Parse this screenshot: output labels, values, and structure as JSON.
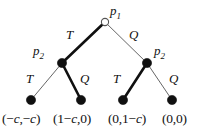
{
  "diagram": {
    "type": "extensive-form-game-tree",
    "title": "",
    "colors": {
      "line": "#555555",
      "bold_line": "#101010",
      "node_fill": "#101010",
      "root_fill": "#ffffff",
      "text": "#111111",
      "background": "#ffffff"
    },
    "nodes": [
      {
        "id": "root",
        "label": "p",
        "sub": "1",
        "x": 105,
        "y": 22,
        "filled": false,
        "r": 3.6,
        "label_x": 110,
        "label_y": 4
      },
      {
        "id": "left",
        "label": "p",
        "sub": "2",
        "x": 62,
        "y": 63,
        "filled": true,
        "r": 4.6,
        "label_x": 33,
        "label_y": 44
      },
      {
        "id": "right",
        "label": "p",
        "sub": "2",
        "x": 147,
        "y": 63,
        "filled": true,
        "r": 4.6,
        "label_x": 154,
        "label_y": 44
      },
      {
        "id": "leaf1",
        "label": "",
        "sub": "",
        "x": 31,
        "y": 100,
        "filled": true,
        "r": 4.6,
        "label_x": 0,
        "label_y": 0
      },
      {
        "id": "leaf2",
        "label": "",
        "sub": "",
        "x": 81,
        "y": 100,
        "filled": true,
        "r": 4.6,
        "label_x": 0,
        "label_y": 0
      },
      {
        "id": "leaf3",
        "label": "",
        "sub": "",
        "x": 123,
        "y": 100,
        "filled": true,
        "r": 4.6,
        "label_x": 0,
        "label_y": 0
      },
      {
        "id": "leaf4",
        "label": "",
        "sub": "",
        "x": 172,
        "y": 100,
        "filled": true,
        "r": 4.6,
        "label_x": 0,
        "label_y": 0
      }
    ],
    "edges": [
      {
        "id": "root-T",
        "from": "root",
        "to": "left",
        "label": "T",
        "bold": true,
        "label_x": 66,
        "label_y": 28
      },
      {
        "id": "root-Q",
        "from": "root",
        "to": "right",
        "label": "Q",
        "bold": false,
        "label_x": 129,
        "label_y": 28
      },
      {
        "id": "left-T",
        "from": "left",
        "to": "leaf1",
        "label": "T",
        "bold": false,
        "label_x": 26,
        "label_y": 72
      },
      {
        "id": "left-Q",
        "from": "left",
        "to": "leaf2",
        "label": "Q",
        "bold": true,
        "label_x": 80,
        "label_y": 72
      },
      {
        "id": "right-T",
        "from": "right",
        "to": "leaf3",
        "label": "T",
        "bold": true,
        "label_x": 113,
        "label_y": 72
      },
      {
        "id": "right-Q",
        "from": "right",
        "to": "leaf4",
        "label": "Q",
        "bold": false,
        "label_x": 169,
        "label_y": 72
      }
    ],
    "payoffs": [
      {
        "id": "payoff1",
        "text": "(−c,−c)",
        "x": 2,
        "y": 112
      },
      {
        "id": "payoff2",
        "text": "(1−c,0)",
        "x": 53,
        "y": 112
      },
      {
        "id": "payoff3",
        "text": "(0,1−c)",
        "x": 108,
        "y": 112
      },
      {
        "id": "payoff4",
        "text": "(0,0)",
        "x": 162,
        "y": 112
      }
    ]
  }
}
